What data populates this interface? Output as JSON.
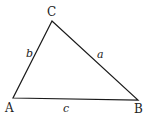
{
  "diagram": {
    "type": "triangle",
    "stroke_color": "#1a1a1a",
    "vertices": [
      {
        "label": "A",
        "x": 13,
        "y": 98,
        "label_x": 5,
        "label_y": 112
      },
      {
        "label": "B",
        "x": 138,
        "y": 100,
        "label_x": 134,
        "label_y": 113
      },
      {
        "label": "C",
        "x": 52,
        "y": 21,
        "label_x": 47,
        "label_y": 16
      }
    ],
    "sides": [
      {
        "label": "a",
        "between": "B-C",
        "label_x": 97,
        "label_y": 58
      },
      {
        "label": "b",
        "between": "A-C",
        "label_x": 26,
        "label_y": 57
      },
      {
        "label": "c",
        "between": "A-B",
        "label_x": 63,
        "label_y": 112
      }
    ]
  }
}
